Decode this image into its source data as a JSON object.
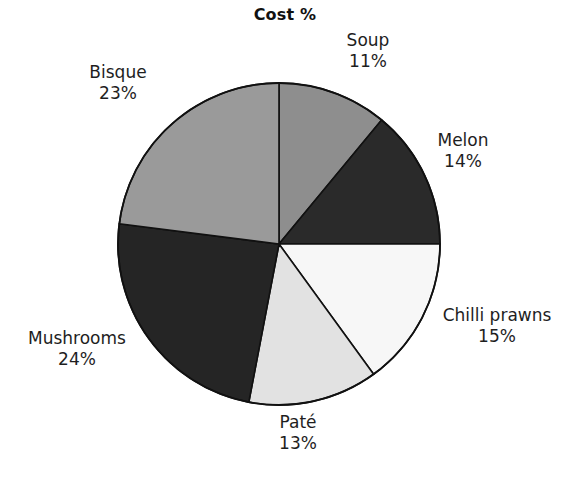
{
  "chart_data": {
    "type": "pie",
    "title": "Cost %",
    "xlabel": "",
    "ylabel": "",
    "legend_position": "none",
    "grid": false,
    "value_suffix": "%",
    "start_angle_deg": 0,
    "direction": "clockwise",
    "categories": [
      "Soup",
      "Melon",
      "Chilli prawns",
      "Paté",
      "Mushrooms",
      "Bisque"
    ],
    "values": [
      11,
      14,
      15,
      13,
      24,
      23
    ],
    "slices": [
      {
        "label": "Soup",
        "value": 11,
        "value_text": "11%",
        "color": "#8e8e8e"
      },
      {
        "label": "Melon",
        "value": 14,
        "value_text": "14%",
        "color": "#2a2a2a"
      },
      {
        "label": "Chilli prawns",
        "value": 15,
        "value_text": "15%",
        "color": "#f7f7f7"
      },
      {
        "label": "Paté",
        "value": 13,
        "value_text": "13%",
        "color": "#e2e2e2"
      },
      {
        "label": "Mushrooms",
        "value": 24,
        "value_text": "24%",
        "color": "#252525"
      },
      {
        "label": "Bisque",
        "value": 23,
        "value_text": "23%",
        "color": "#9a9a9a"
      }
    ],
    "outline_color": "#111111",
    "background": "#ffffff"
  }
}
